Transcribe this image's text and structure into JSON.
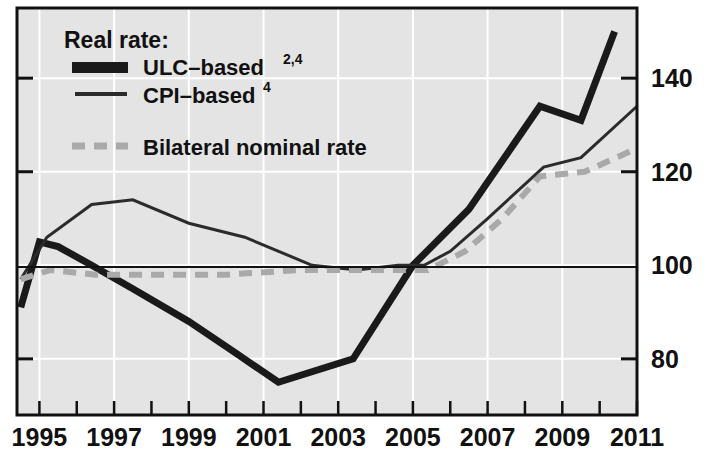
{
  "chart_data": {
    "type": "line",
    "title": "",
    "subtitle": "",
    "xlabel": "",
    "ylabel": "",
    "xlim": [
      1994.4,
      2011.0
    ],
    "ylim": [
      68,
      155
    ],
    "yticks": [
      80,
      100,
      120,
      140
    ],
    "ytick_labels": [
      "80",
      "100",
      "120",
      "140"
    ],
    "xticks": [
      1995,
      1996,
      1997,
      1998,
      1999,
      2000,
      2001,
      2002,
      2003,
      2004,
      2005,
      2006,
      2007,
      2008,
      2009,
      2010,
      2011
    ],
    "xtick_labels_shown": [
      "1995",
      "1997",
      "1999",
      "2001",
      "2003",
      "2005",
      "2007",
      "2009",
      "2011"
    ],
    "xtick_labels_values": [
      1995,
      1997,
      1999,
      2001,
      2003,
      2005,
      2007,
      2009,
      2011
    ],
    "grid": true,
    "grid_color": "#ffffff",
    "plot_background": "#e4e4e4",
    "baseline_value": 100,
    "legend_position": "top-left",
    "legend_title": "Real rate:",
    "series": [
      {
        "name": "ULC-based",
        "name_superscript": "2,4",
        "style": "solid-thick",
        "color": "#1a1a1a",
        "width": 7,
        "x": [
          1994.5,
          1995.0,
          1995.5,
          1996.4,
          1997.5,
          1999.0,
          2000.3,
          2001.4,
          2003.4,
          2005.0,
          2006.5,
          2008.4,
          2009.5,
          2010.4
        ],
        "y": [
          91,
          105,
          104,
          100,
          95,
          88,
          81,
          75,
          80,
          100,
          112,
          134,
          131,
          150
        ]
      },
      {
        "name": "CPI-based",
        "name_superscript": "4",
        "style": "solid-thin",
        "color": "#2b2b2b",
        "width": 3,
        "x": [
          1994.5,
          1995.2,
          1996.4,
          1997.5,
          1999.0,
          2000.5,
          2002.3,
          2003.5,
          2004.6,
          2005.3,
          2006.0,
          2007.0,
          2008.5,
          2009.5,
          2011.0
        ],
        "y": [
          97,
          106,
          113,
          114,
          109,
          106,
          100,
          99,
          100,
          100,
          103,
          110,
          121,
          123,
          134
        ]
      },
      {
        "name": "Bilateral nominal rate",
        "name_superscript": "",
        "style": "dashed-thick",
        "color": "#a9a9a9",
        "width": 6,
        "x": [
          1994.5,
          1995.3,
          1996.5,
          1998.0,
          2000.0,
          2002.0,
          2003.5,
          2004.6,
          2005.4,
          2006.4,
          2007.4,
          2008.4,
          2009.6,
          2011.0
        ],
        "y": [
          97,
          99,
          98,
          98,
          98,
          99,
          99,
          99,
          99,
          103,
          110,
          119,
          120,
          125
        ]
      }
    ]
  },
  "legend": {
    "title": "Real rate:",
    "entries": [
      {
        "label": "ULC–based",
        "superscript": "2,4",
        "swatch": "solid-thick-swatch"
      },
      {
        "label": "CPI–based",
        "superscript": "4",
        "swatch": "solid-thin-swatch"
      },
      {
        "label": "Bilateral nominal rate",
        "superscript": "",
        "swatch": "dashed-swatch"
      }
    ]
  },
  "axes": {
    "y_right_labels": [
      "140",
      "120",
      "100",
      "80"
    ],
    "x_labels": [
      "1995",
      "1997",
      "1999",
      "2001",
      "2003",
      "2005",
      "2007",
      "2009",
      "2011"
    ]
  }
}
